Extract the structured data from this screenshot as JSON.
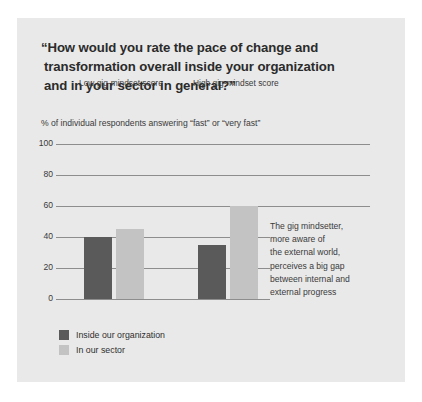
{
  "panel": {
    "background": "#e9e9e9"
  },
  "title": {
    "line1": "“How would you rate the pace of change and",
    "line2": "transformation overall inside your organization",
    "line3": "and in your sector in general?”"
  },
  "annotation": {
    "line1": "The gig mindsetter,",
    "line2": "more aware of",
    "line3": "the external world,",
    "line4": "perceives a big gap",
    "line5": "between internal and",
    "line6": "external progress"
  },
  "chart_data": {
    "type": "bar",
    "title": "“How would you rate the pace of change and transformation overall inside your organization and in your sector in general?”",
    "subtitle": "% of individual respondents answering “fast” or “very fast”",
    "xlabel": "",
    "ylabel": "",
    "categories": [
      "Low gig-mindset score",
      "High gig-mindset score"
    ],
    "series": [
      {
        "name": "Inside our organization",
        "color": "#5a5a5a",
        "values": [
          40,
          35
        ]
      },
      {
        "name": "In our sector",
        "color": "#c3c3c3",
        "values": [
          45,
          60
        ]
      }
    ],
    "ylim": [
      0,
      100
    ],
    "yticks": [
      0,
      20,
      40,
      60,
      80,
      100
    ],
    "ytick_labels": [
      "0",
      "20",
      "40",
      "60",
      "80",
      "100"
    ],
    "grid": true,
    "legend_position": "bottom-left",
    "annotation": "The gig mindsetter, more aware of the external world, perceives a big gap between internal and external progress"
  }
}
